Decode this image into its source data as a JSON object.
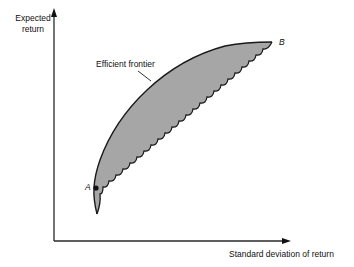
{
  "diagram": {
    "axes": {
      "y_label_line1": "Expected",
      "y_label_line2": "return",
      "x_label": "Standard deviation of return"
    },
    "annotations": {
      "curve_label": "Efficient frontier",
      "point_a": "A",
      "point_b": "B"
    },
    "colors": {
      "region_fill": "#a6a6a6",
      "stroke": "#1a1a1a",
      "axis": "#2a2a2a"
    }
  }
}
